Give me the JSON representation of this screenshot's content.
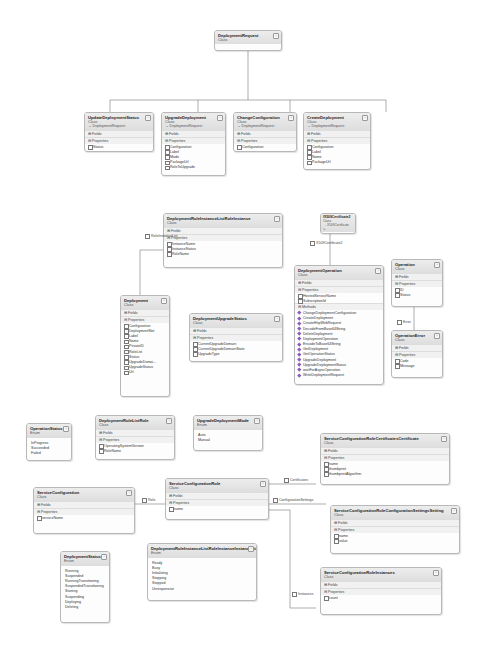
{
  "diagram": {
    "classes": {
      "deploymentRequest": {
        "name": "DeploymentRequest",
        "kind": "Class"
      },
      "updateDeploymentStatus": {
        "name": "UpdateDeploymentStatus",
        "kind": "Class",
        "base": "→ DeploymentRequest",
        "fields": "Fields",
        "properties_label": "Properties",
        "properties": [
          "Status"
        ]
      },
      "upgradeDeployment": {
        "name": "UpgradeDeployment",
        "kind": "Class",
        "base": "→ DeploymentRequest",
        "fields": "Fields",
        "properties_label": "Properties",
        "properties": [
          "Configuration",
          "Label",
          "Mode",
          "PackageUrl",
          "RoleToUpgrade"
        ]
      },
      "changeConfiguration": {
        "name": "ChangeConfiguration",
        "kind": "Class",
        "base": "→ DeploymentRequest",
        "fields": "Fields",
        "properties_label": "Properties",
        "properties": [
          "Configuration"
        ]
      },
      "createDeployment": {
        "name": "CreateDeployment",
        "kind": "Class",
        "base": "→ DeploymentRequest",
        "fields": "Fields",
        "properties_label": "Properties",
        "properties": [
          "Configuration",
          "Label",
          "Name",
          "PackageUrl"
        ]
      },
      "roleInstanceListRoleInstance": {
        "name": "DeploymentRoleInstanceListRoleInstance",
        "kind": "Class",
        "fields": "Fields",
        "properties_label": "Properties",
        "properties": [
          "InstanceName",
          "InstanceStatus",
          "RoleName"
        ]
      },
      "x509": {
        "name": "IX509Certificate2",
        "kind": "Class",
        "base": "→ X509Certificate",
        "extra": "↳"
      },
      "deploymentOperation": {
        "name": "DeploymentOperation",
        "kind": "Class",
        "fields": "Fields",
        "properties_label": "Properties",
        "properties": [
          "HostedServiceName",
          "SubscriptionId"
        ],
        "methods_label": "Methods",
        "methods": [
          "ChangeDeploymentConfiguration",
          "CreateDeployment",
          "CreateHttpWebRequest",
          "DecodeFromBase64String",
          "DeleteDeployment",
          "DeploymentOperation",
          "EncodeToBase64String",
          "GetDeployment",
          "GetOperationStatus",
          "UpgradeDeployment",
          "UpgradeDeploymentStatus",
          "waitForAsyncOperation",
          "WriteDeploymentRequest"
        ]
      },
      "operation": {
        "name": "Operation",
        "kind": "Class",
        "fields": "Fields",
        "properties_label": "Properties",
        "properties": [
          "ID",
          "Status"
        ]
      },
      "operationError": {
        "name": "OperationError",
        "kind": "Class",
        "fields": "Fields",
        "properties_label": "Properties",
        "properties": [
          "Code",
          "Message"
        ]
      },
      "deployment": {
        "name": "Deployment",
        "kind": "Class",
        "fields": "Fields",
        "properties_label": "Properties",
        "properties": [
          "Configuration",
          "DeploymentSlot",
          "Label",
          "Name",
          "PrivateID",
          "RoleList",
          "Status",
          "UpgradeDomai...",
          "UpgradeStatus",
          "Url"
        ]
      },
      "deploymentUpgradeStatus": {
        "name": "DeploymentUpgradeStatus",
        "kind": "Class",
        "fields": "Fields",
        "properties_label": "Properties",
        "properties": [
          "CurrentUpgradeDomain",
          "CurrentUpgradeDomainState",
          "UpgradeType"
        ]
      },
      "operationStatus": {
        "name": "OperationStatus",
        "kind": "Enum",
        "values": [
          "InProgress",
          "Succeeded",
          "Failed"
        ]
      },
      "deploymentRoleListRole": {
        "name": "DeploymentRoleListRole",
        "kind": "Class",
        "fields": "Fields",
        "properties_label": "Properties",
        "properties": [
          "OperatingSystemVersion",
          "RoleName"
        ]
      },
      "upgradeDeploymentMode": {
        "name": "UpgradeDeploymentMode",
        "kind": "Enum",
        "values": [
          "Auto",
          "Manual"
        ]
      },
      "certificatesCertificate": {
        "name": "ServiceConfigurationRoleCertificatesCertificate",
        "kind": "Class",
        "fields": "Fields",
        "properties_label": "Properties",
        "properties": [
          "name",
          "thumbprint",
          "thumbprintAlgorithm"
        ]
      },
      "serviceConfiguration": {
        "name": "ServiceConfiguration",
        "kind": "Class",
        "fields": "Fields",
        "properties_label": "Properties",
        "properties": [
          "serviceName"
        ]
      },
      "serviceConfigurationRole": {
        "name": "ServiceConfigurationRole",
        "kind": "Class",
        "fields": "Fields",
        "properties_label": "Properties",
        "properties": [
          "name"
        ]
      },
      "configurationSettingsSetting": {
        "name": "ServiceConfigurationRoleConfigurationSettingsSetting",
        "kind": "Class",
        "fields": "Fields",
        "properties_label": "Properties",
        "properties": [
          "name",
          "value"
        ]
      },
      "deploymentStatus": {
        "name": "DeploymentStatus",
        "kind": "Enum",
        "values": [
          "Running",
          "Suspended",
          "RunningTransitioning",
          "SuspendedTransitioning",
          "Starting",
          "Suspending",
          "Deploying",
          "Deleting"
        ]
      },
      "instanceStatus": {
        "name": "DeploymentRoleInstanceListRoleInstanceInstanceStatus",
        "kind": "Enum",
        "values": [
          "Ready",
          "Busy",
          "Initializing",
          "Stopping",
          "Stopped",
          "Unresponsive"
        ]
      },
      "roleInstances": {
        "name": "ServiceConfigurationRoleInstances",
        "kind": "Class",
        "fields": "Fields",
        "properties_label": "Properties",
        "properties": [
          "count"
        ]
      }
    },
    "associations": {
      "roleInstanceList": "RoleInstanceList",
      "x509Certificate2": "X509Certificate2",
      "error": "Error",
      "role": "Role",
      "certificates": "Certificates",
      "configurationSettings": "ConfigurationSettings",
      "instances": "Instances"
    }
  }
}
